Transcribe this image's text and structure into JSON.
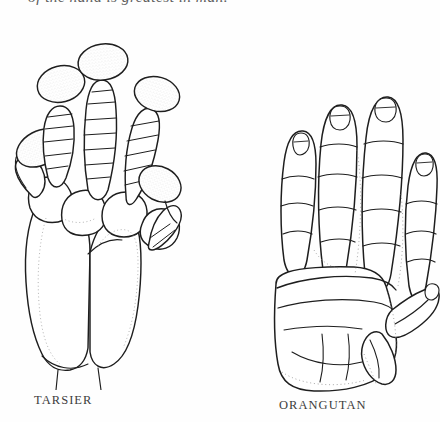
{
  "page": {
    "top_running_text": "of the hand is greatest in man.",
    "background_color": "#fefefe",
    "ink_color": "#222222"
  },
  "figure": {
    "kind": "scientific-illustration",
    "specimens": [
      {
        "id": "tarsier",
        "caption": "TARSIER",
        "icon_name": "tarsier-hand-illustration",
        "digit_count": 5,
        "notable_feature": "expanded oval adhesive digital pads",
        "stroke_color": "#1e1e1e"
      },
      {
        "id": "orangutan",
        "caption": "ORANGUTAN",
        "icon_name": "orangutan-hand-illustration",
        "digit_count": 5,
        "notable_feature": "long curved fingers with short opposable thumb",
        "stroke_color": "#1e1e1e"
      }
    ]
  }
}
